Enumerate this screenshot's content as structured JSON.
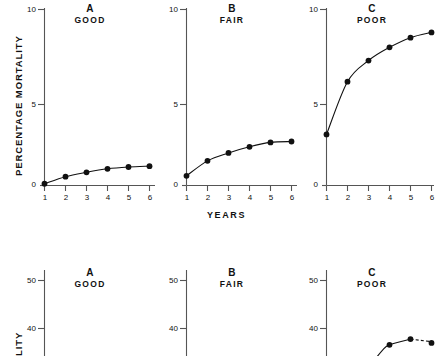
{
  "figure": {
    "ylabel_row1": "PERCENTAGE MORTALITY",
    "ylabel_row2_partial": "LITY",
    "xlabel_row1": "YEARS"
  },
  "chart_data": [
    {
      "type": "line",
      "panel_id": "A",
      "row": 1,
      "title": "A",
      "subtitle": "GOOD",
      "xlabel": "YEARS",
      "ylabel": "PERCENTAGE MORTALITY",
      "x": [
        1,
        2,
        3,
        4,
        5,
        6
      ],
      "values": [
        0.1,
        0.5,
        0.75,
        0.95,
        1.05,
        1.1
      ],
      "xtick_labels": [
        "1",
        "2",
        "3",
        "4",
        "5",
        "6"
      ],
      "ytick_labels": [
        "0",
        "5",
        "10"
      ],
      "yticks": [
        0,
        5,
        10
      ],
      "ylim": [
        0,
        10
      ],
      "xlim": [
        1,
        6
      ],
      "grid": false,
      "legend": "none",
      "marker": "filled-circle"
    },
    {
      "type": "line",
      "panel_id": "B",
      "row": 1,
      "title": "B",
      "subtitle": "FAIR",
      "xlabel": "YEARS",
      "ylabel": "",
      "x": [
        1,
        2,
        3,
        4,
        5,
        6
      ],
      "values": [
        0.55,
        1.4,
        1.85,
        2.2,
        2.45,
        2.5
      ],
      "xtick_labels": [
        "1",
        "2",
        "3",
        "4",
        "5",
        "6"
      ],
      "ytick_labels": [
        "0",
        "5",
        "10"
      ],
      "yticks": [
        0,
        5,
        10
      ],
      "ylim": [
        0,
        10
      ],
      "xlim": [
        1,
        6
      ],
      "grid": false,
      "legend": "none",
      "marker": "filled-circle"
    },
    {
      "type": "line",
      "panel_id": "C",
      "row": 1,
      "title": "C",
      "subtitle": "POOR",
      "xlabel": "YEARS",
      "ylabel": "",
      "x": [
        1,
        2,
        3,
        4,
        5,
        6
      ],
      "values": [
        2.9,
        5.9,
        7.1,
        7.85,
        8.4,
        8.7
      ],
      "xtick_labels": [
        "1",
        "2",
        "3",
        "4",
        "5",
        "6"
      ],
      "ytick_labels": [
        "0",
        "5",
        "10"
      ],
      "yticks": [
        0,
        5,
        10
      ],
      "ylim": [
        0,
        10
      ],
      "xlim": [
        1,
        6
      ],
      "grid": false,
      "legend": "none",
      "marker": "filled-circle"
    },
    {
      "type": "line",
      "panel_id": "A2",
      "row": 2,
      "title": "A",
      "subtitle": "GOOD",
      "xlabel": "",
      "ylabel": "LITY",
      "x": [],
      "values": [],
      "xtick_labels": [],
      "ytick_labels": [
        "50",
        "40"
      ],
      "yticks": [
        50,
        40
      ],
      "ylim": [
        34,
        53
      ],
      "grid": false,
      "legend": "none",
      "marker": "filled-circle",
      "note": "panel cropped by bottom edge of image; no data points visible"
    },
    {
      "type": "line",
      "panel_id": "B2",
      "row": 2,
      "title": "B",
      "subtitle": "FAIR",
      "xlabel": "",
      "ylabel": "",
      "x": [],
      "values": [],
      "xtick_labels": [],
      "ytick_labels": [
        "50",
        "40"
      ],
      "yticks": [
        50,
        40
      ],
      "ylim": [
        34,
        53
      ],
      "grid": false,
      "legend": "none",
      "marker": "filled-circle",
      "note": "panel cropped by bottom edge of image; no data points visible"
    },
    {
      "type": "line",
      "panel_id": "C2",
      "row": 2,
      "title": "C",
      "subtitle": "POOR",
      "xlabel": "",
      "ylabel": "",
      "x": [
        4,
        5,
        6
      ],
      "values": [
        36.6,
        37.8,
        37.0
      ],
      "xtick_labels": [],
      "ytick_labels": [
        "50",
        "40"
      ],
      "yticks": [
        50,
        40
      ],
      "ylim": [
        34,
        53
      ],
      "grid": false,
      "legend": "none",
      "marker": "filled-circle",
      "dashed_segment": true,
      "note": "partially visible curve clipped by bottom edge; short dashed stub extends right from peak"
    }
  ],
  "colors": {
    "background": "#ffffff",
    "ink": "#111111",
    "axis": "#555555"
  }
}
